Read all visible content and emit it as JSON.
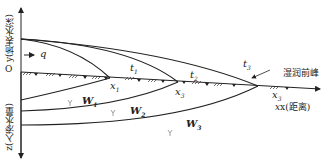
{
  "figure": {
    "y_axis_label": "y(地表水深)",
    "z_axis_label": "z(入渗水量)",
    "origin_label": "O",
    "inflow_label": "q",
    "x_axis_label": "x(距离)",
    "wetting_front_label": "湿润前峰",
    "time_labels": [
      "t",
      "t",
      "t"
    ],
    "time_subscripts": [
      "1",
      "2",
      "3"
    ],
    "position_labels": [
      "x",
      "x",
      "x"
    ],
    "position_subscripts": [
      "1",
      "3",
      "3"
    ],
    "infiltration_labels": [
      "W",
      "W",
      "W"
    ],
    "infiltration_subscripts": [
      "1",
      "2",
      "3"
    ]
  },
  "colors": {
    "line": "#222222",
    "marker": "#888888"
  }
}
